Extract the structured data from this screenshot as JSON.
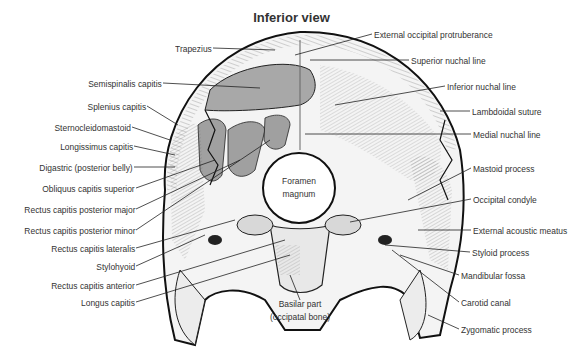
{
  "title": "Inferior view",
  "labels_left": [
    {
      "text": "Trapezius",
      "x": 212,
      "y": 48
    },
    {
      "text": "Semispinalis capitis",
      "x": 162,
      "y": 83
    },
    {
      "text": "Splenius capitis",
      "x": 146,
      "y": 106
    },
    {
      "text": "Sternocleidomastoid",
      "x": 131,
      "y": 127
    },
    {
      "text": "Longissimus capitis",
      "x": 133,
      "y": 146
    },
    {
      "text": "Digastric (posterior belly)",
      "x": 133,
      "y": 167
    },
    {
      "text": "Obliquus capitis superior",
      "x": 135,
      "y": 188
    },
    {
      "text": "Rectus capitis posterior major",
      "x": 135,
      "y": 209
    },
    {
      "text": "Rectus capitis posterior minor",
      "x": 135,
      "y": 230
    },
    {
      "text": "Rectus capitis lateralis",
      "x": 135,
      "y": 248
    },
    {
      "text": "Stylohyoid",
      "x": 135,
      "y": 266
    },
    {
      "text": "Rectus capitis anterior",
      "x": 135,
      "y": 285
    },
    {
      "text": "Longus capitis",
      "x": 135,
      "y": 302
    }
  ],
  "labels_right": [
    {
      "text": "External occipital protruberance",
      "x": 374,
      "y": 34
    },
    {
      "text": "Superior nuchal line",
      "x": 411,
      "y": 60
    },
    {
      "text": "Inferior nuchal line",
      "x": 447,
      "y": 86
    },
    {
      "text": "Lambdoidal suture",
      "x": 472,
      "y": 111
    },
    {
      "text": "Medial nuchal line",
      "x": 473,
      "y": 134
    },
    {
      "text": "Mastoid process",
      "x": 473,
      "y": 168
    },
    {
      "text": "Occipital condyle",
      "x": 473,
      "y": 199
    },
    {
      "text": "External acoustic meatus",
      "x": 473,
      "y": 230
    },
    {
      "text": "Styloid process",
      "x": 472,
      "y": 252
    },
    {
      "text": "Mandibular fossa",
      "x": 461,
      "y": 275
    },
    {
      "text": "Carotid canal",
      "x": 461,
      "y": 302
    },
    {
      "text": "Zygomatic process",
      "x": 461,
      "y": 329
    }
  ],
  "labels_center": [
    {
      "text": "Foramen",
      "x": 299,
      "y": 180
    },
    {
      "text": "magnum",
      "x": 299,
      "y": 193
    },
    {
      "text": "Basilar part",
      "x": 300,
      "y": 303
    },
    {
      "text": "(occipatal bone)",
      "x": 300,
      "y": 316
    }
  ]
}
